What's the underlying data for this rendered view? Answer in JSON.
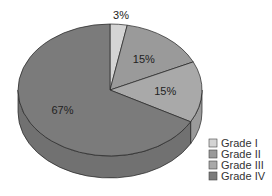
{
  "chart_data": {
    "type": "pie",
    "title": "",
    "categories": [
      "Grade I",
      "Grade II",
      "Grade III",
      "Grade IV"
    ],
    "values": [
      3,
      15,
      15,
      67
    ],
    "labels": [
      "3%",
      "15%",
      "15%",
      "67%"
    ],
    "colors": [
      "#d4d4d4",
      "#9a9a9a",
      "#a9a9a9",
      "#7b7b7b"
    ],
    "legend_position": "bottom-right",
    "style": "3d"
  },
  "legend": {
    "items": [
      {
        "label": "Grade I",
        "color": "#d4d4d4"
      },
      {
        "label": "Grade II",
        "color": "#9a9a9a"
      },
      {
        "label": "Grade III",
        "color": "#a9a9a9"
      },
      {
        "label": "Grade IV",
        "color": "#7b7b7b"
      }
    ]
  }
}
